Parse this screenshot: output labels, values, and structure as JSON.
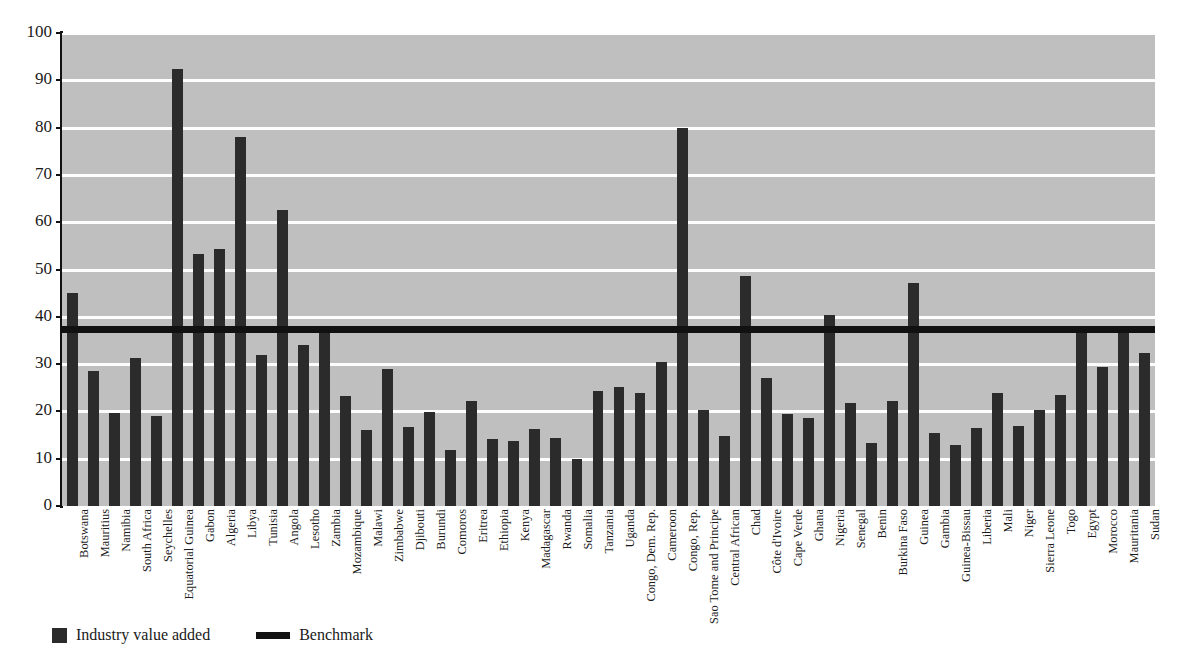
{
  "chart_data": {
    "type": "bar",
    "title": "",
    "xlabel": "",
    "ylabel": "",
    "ylim": [
      0,
      100
    ],
    "yticks": [
      0,
      10,
      20,
      30,
      40,
      50,
      60,
      70,
      80,
      90,
      100
    ],
    "grid": true,
    "legend_position": "bottom-left",
    "categories": [
      "Botswana",
      "Mauritius",
      "Namibia",
      "South Africa",
      "Seychelles",
      "Equatorial Guinea",
      "Gabon",
      "Algeria",
      "Libya",
      "Tunisia",
      "Angola",
      "Lesotho",
      "Zambia",
      "Mozambique",
      "Malawi",
      "Zimbabwe",
      "Djibouti",
      "Burundi",
      "Comoros",
      "Eritrea",
      "Ethiopia",
      "Kenya",
      "Madagascar",
      "Rwanda",
      "Somalia",
      "Tanzania",
      "Uganda",
      "Congo, Dem. Rep.",
      "Cameroon",
      "Congo, Rep.",
      "Sao Tome and Principe",
      "Central African",
      "Chad",
      "Côte d'Ivoire",
      "Cape Verde",
      "Ghana",
      "Nigeria",
      "Senegal",
      "Benin",
      "Burkina Faso",
      "Guinea",
      "Gambia",
      "Guinea-Bissau",
      "Liberia",
      "Mali",
      "Niger",
      "Sierra Leone",
      "Togo",
      "Egypt",
      "Morocco",
      "Mauritania",
      "Sudan"
    ],
    "series": [
      {
        "name": "Industry value added",
        "color": "#2b2b2b",
        "values": [
          45.0,
          28.5,
          19.7,
          31.2,
          19.0,
          92.3,
          53.3,
          54.3,
          78.0,
          32.0,
          62.5,
          34.0,
          37.6,
          23.2,
          16.0,
          28.9,
          16.8,
          19.9,
          11.8,
          22.2,
          14.2,
          13.8,
          16.3,
          14.3,
          10.0,
          24.3,
          25.2,
          23.9,
          30.5,
          80.0,
          20.3,
          14.7,
          48.7,
          27.0,
          19.5,
          18.6,
          40.4,
          21.8,
          13.4,
          22.1,
          47.2,
          15.4,
          13.0,
          16.4,
          23.9,
          16.9,
          20.3,
          23.4,
          37.5,
          29.4,
          37.0,
          32.4
        ]
      }
    ],
    "benchmark": {
      "name": "Benchmark",
      "value": 37.5,
      "color": "#111111"
    }
  },
  "legend": {
    "items": [
      {
        "label": "Industry value added",
        "marker": "square-swatch",
        "color": "#2b2b2b"
      },
      {
        "label": "Benchmark",
        "marker": "line-swatch",
        "color": "#111111"
      }
    ]
  },
  "axis": {
    "y_tick_labels": [
      "100",
      "90",
      "80",
      "70",
      "60",
      "50",
      "40",
      "30",
      "20",
      "10",
      "0"
    ]
  },
  "colors": {
    "plot_background": "#bfbfbf",
    "gridline": "#fdfdfd",
    "bar": "#2b2b2b",
    "benchmark": "#111111",
    "axis": "#111111",
    "text": "#1a1a1a",
    "page_background": "#ffffff"
  }
}
